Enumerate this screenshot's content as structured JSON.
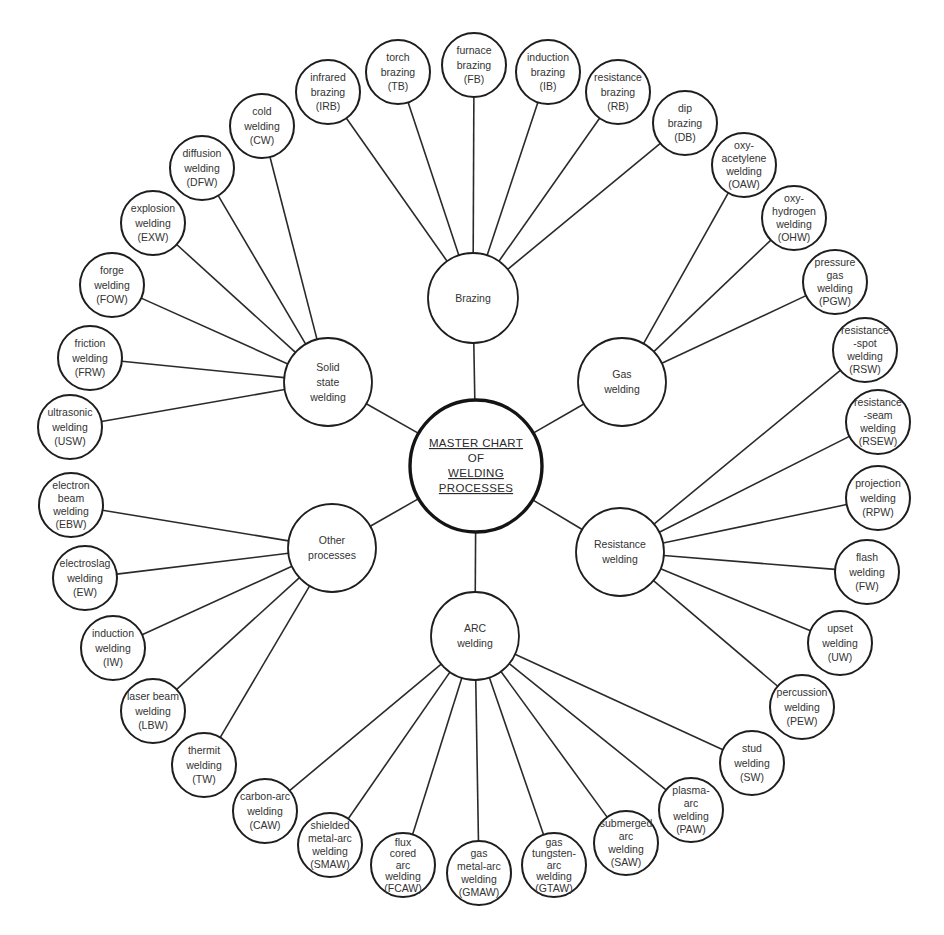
{
  "root": {
    "id": "master",
    "x": 476,
    "y": 466,
    "r": 66,
    "lines": [
      "MASTER CHART",
      "OF",
      "WELDING",
      "PROCESSES"
    ],
    "underlined": [
      true,
      false,
      true,
      true
    ]
  },
  "hubs": [
    {
      "id": "brazing",
      "x": 473,
      "y": 298,
      "r": 45,
      "lines": [
        "Brazing"
      ]
    },
    {
      "id": "gas",
      "x": 622,
      "y": 382,
      "r": 44,
      "lines": [
        "Gas",
        "welding"
      ]
    },
    {
      "id": "resistance",
      "x": 620,
      "y": 552,
      "r": 44,
      "lines": [
        "Resistance",
        "welding"
      ]
    },
    {
      "id": "arc",
      "x": 475,
      "y": 636,
      "r": 44,
      "lines": [
        "ARC",
        "welding"
      ]
    },
    {
      "id": "other",
      "x": 332,
      "y": 548,
      "r": 44,
      "lines": [
        "Other",
        "processes"
      ]
    },
    {
      "id": "solid",
      "x": 328,
      "y": 382,
      "r": 44,
      "lines": [
        "Solid",
        "state",
        "welding"
      ]
    }
  ],
  "leaves": [
    {
      "id": "IRB",
      "hub": "brazing",
      "x": 328,
      "y": 92,
      "lines": [
        "infrared",
        "brazing",
        "(IRB)"
      ]
    },
    {
      "id": "TB",
      "hub": "brazing",
      "x": 398,
      "y": 72,
      "lines": [
        "torch",
        "brazing",
        "(TB)"
      ]
    },
    {
      "id": "FB",
      "hub": "brazing",
      "x": 474,
      "y": 65,
      "lines": [
        "furnace",
        "brazing",
        "(FB)"
      ]
    },
    {
      "id": "IB",
      "hub": "brazing",
      "x": 548,
      "y": 72,
      "lines": [
        "induction",
        "brazing",
        "(IB)"
      ]
    },
    {
      "id": "RB",
      "hub": "brazing",
      "x": 618,
      "y": 92,
      "lines": [
        "resistance",
        "brazing",
        "(RB)"
      ]
    },
    {
      "id": "DB",
      "hub": "brazing",
      "x": 685,
      "y": 123,
      "lines": [
        "dip",
        "brazing",
        "(DB)"
      ]
    },
    {
      "id": "OAW",
      "hub": "gas",
      "x": 744,
      "y": 165,
      "lines": [
        "oxy-",
        "acetylene",
        "welding",
        "(OAW)"
      ]
    },
    {
      "id": "OHW",
      "hub": "gas",
      "x": 794,
      "y": 218,
      "lines": [
        "oxy-",
        "hydrogen",
        "welding",
        "(OHW)"
      ]
    },
    {
      "id": "PGW",
      "hub": "gas",
      "x": 835,
      "y": 282,
      "lines": [
        "pressure",
        "gas",
        "welding",
        "(PGW)"
      ]
    },
    {
      "id": "RSW",
      "hub": "resistance",
      "x": 865,
      "y": 350,
      "lines": [
        "resistance",
        "-spot",
        "welding",
        "(RSW)"
      ]
    },
    {
      "id": "RSEW",
      "hub": "resistance",
      "x": 878,
      "y": 422,
      "lines": [
        "resistance",
        "-seam",
        "welding",
        "(RSEW)"
      ]
    },
    {
      "id": "RPW",
      "hub": "resistance",
      "x": 878,
      "y": 498,
      "lines": [
        "projection",
        "welding",
        "(RPW)"
      ]
    },
    {
      "id": "FW",
      "hub": "resistance",
      "x": 867,
      "y": 572,
      "lines": [
        "flash",
        "welding",
        "(FW)"
      ]
    },
    {
      "id": "UW",
      "hub": "resistance",
      "x": 840,
      "y": 643,
      "lines": [
        "upset",
        "welding",
        "(UW)"
      ]
    },
    {
      "id": "PEW",
      "hub": "resistance",
      "x": 802,
      "y": 707,
      "lines": [
        "percussion",
        "welding",
        "(PEW)"
      ]
    },
    {
      "id": "SW",
      "hub": "arc",
      "x": 752,
      "y": 763,
      "lines": [
        "stud",
        "welding",
        "(SW)"
      ]
    },
    {
      "id": "PAW",
      "hub": "arc",
      "x": 691,
      "y": 810,
      "lines": [
        "plasma-",
        "arc",
        "welding",
        "(PAW)"
      ]
    },
    {
      "id": "SAW",
      "hub": "arc",
      "x": 626,
      "y": 843,
      "lines": [
        "submerged",
        "arc",
        "welding",
        "(SAW)"
      ]
    },
    {
      "id": "GTAW",
      "hub": "arc",
      "x": 554,
      "y": 865,
      "lines": [
        "gas",
        "tungsten-",
        "arc",
        "welding",
        "(GTAW)"
      ]
    },
    {
      "id": "GMAW",
      "hub": "arc",
      "x": 479,
      "y": 873,
      "lines": [
        "gas",
        "metal-arc",
        "welding",
        "(GMAW)"
      ]
    },
    {
      "id": "FCAW",
      "hub": "arc",
      "x": 403,
      "y": 865,
      "lines": [
        "flux",
        "cored",
        "arc",
        "welding",
        "(FCAW)"
      ]
    },
    {
      "id": "SMAW",
      "hub": "arc",
      "x": 330,
      "y": 845,
      "lines": [
        "shielded",
        "metal-arc",
        "welding",
        "(SMAW)"
      ]
    },
    {
      "id": "CAW",
      "hub": "arc",
      "x": 265,
      "y": 811,
      "lines": [
        "carbon-arc",
        "welding",
        "(CAW)"
      ]
    },
    {
      "id": "TW",
      "hub": "other",
      "x": 204,
      "y": 765,
      "lines": [
        "thermit",
        "welding",
        "(TW)"
      ]
    },
    {
      "id": "LBW",
      "hub": "other",
      "x": 153,
      "y": 711,
      "lines": [
        "laser beam",
        "welding",
        "(LBW)"
      ]
    },
    {
      "id": "IW",
      "hub": "other",
      "x": 113,
      "y": 648,
      "lines": [
        "induction",
        "welding",
        "(IW)"
      ]
    },
    {
      "id": "EW",
      "hub": "other",
      "x": 85,
      "y": 578,
      "lines": [
        "electroslag",
        "welding",
        "(EW)"
      ]
    },
    {
      "id": "EBW",
      "hub": "other",
      "x": 71,
      "y": 505,
      "lines": [
        "electron",
        "beam",
        "welding",
        "(EBW)"
      ]
    },
    {
      "id": "USW",
      "hub": "solid",
      "x": 70,
      "y": 427,
      "lines": [
        "ultrasonic",
        "welding",
        "(USW)"
      ]
    },
    {
      "id": "FRW",
      "hub": "solid",
      "x": 90,
      "y": 358,
      "lines": [
        "friction",
        "welding",
        "(FRW)"
      ]
    },
    {
      "id": "FOW",
      "hub": "solid",
      "x": 112,
      "y": 285,
      "lines": [
        "forge",
        "welding",
        "(FOW)"
      ]
    },
    {
      "id": "EXW",
      "hub": "solid",
      "x": 153,
      "y": 223,
      "lines": [
        "explosion",
        "welding",
        "(EXW)"
      ]
    },
    {
      "id": "DFW",
      "hub": "solid",
      "x": 202,
      "y": 168,
      "lines": [
        "diffusion",
        "welding",
        "(DFW)"
      ]
    },
    {
      "id": "CW",
      "hub": "solid",
      "x": 262,
      "y": 126,
      "lines": [
        "cold",
        "welding",
        "(CW)"
      ]
    }
  ],
  "style": {
    "leaf_radius": 32,
    "line_color": "#2a2a2a",
    "stroke_color": "#1e1e1e",
    "background": "#ffffff"
  }
}
